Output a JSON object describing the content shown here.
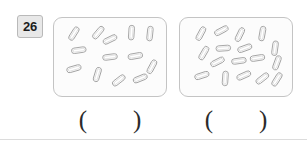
{
  "question": {
    "number": "26",
    "badge_bg": "#e8e8e8",
    "badge_border": "#b9b9b9"
  },
  "style": {
    "box_fill": "#fcfcfc",
    "box_border": "#c4c4c4",
    "pill_stroke": "#9a9a9a",
    "pill_fill": "#ffffff",
    "paren_color": "#2b2b2b"
  },
  "groups": [
    {
      "id": "left",
      "name": "left-group",
      "count": 13,
      "answer_open": "(",
      "answer_close": ")",
      "answer_value": "",
      "pills": [
        {
          "cx": 20,
          "cy": 16,
          "angle": -58
        },
        {
          "cx": 45,
          "cy": 15,
          "angle": -50
        },
        {
          "cx": 57,
          "cy": 22,
          "angle": -26
        },
        {
          "cx": 79,
          "cy": 15,
          "angle": -86
        },
        {
          "cx": 98,
          "cy": 16,
          "angle": -84
        },
        {
          "cx": 25,
          "cy": 33,
          "angle": -8
        },
        {
          "cx": 57,
          "cy": 40,
          "angle": -7
        },
        {
          "cx": 83,
          "cy": 39,
          "angle": -10
        },
        {
          "cx": 100,
          "cy": 50,
          "angle": -62
        },
        {
          "cx": 20,
          "cy": 52,
          "angle": -16
        },
        {
          "cx": 44,
          "cy": 58,
          "angle": -73
        },
        {
          "cx": 66,
          "cy": 64,
          "angle": -38
        },
        {
          "cx": 88,
          "cy": 62,
          "angle": -22
        }
      ]
    },
    {
      "id": "right",
      "name": "right-group",
      "count": 17,
      "answer_open": "(",
      "answer_close": ")",
      "answer_value": "",
      "pills": [
        {
          "cx": 21,
          "cy": 16,
          "angle": -62
        },
        {
          "cx": 42,
          "cy": 13,
          "angle": -28
        },
        {
          "cx": 61,
          "cy": 17,
          "angle": -64
        },
        {
          "cx": 84,
          "cy": 16,
          "angle": -80
        },
        {
          "cx": 24,
          "cy": 36,
          "angle": -60
        },
        {
          "cx": 44,
          "cy": 31,
          "angle": -4
        },
        {
          "cx": 66,
          "cy": 31,
          "angle": -20
        },
        {
          "cx": 97,
          "cy": 31,
          "angle": -82
        },
        {
          "cx": 38,
          "cy": 45,
          "angle": -27
        },
        {
          "cx": 60,
          "cy": 44,
          "angle": -8
        },
        {
          "cx": 79,
          "cy": 41,
          "angle": -9
        },
        {
          "cx": 99,
          "cy": 46,
          "angle": -70
        },
        {
          "cx": 22,
          "cy": 59,
          "angle": -18
        },
        {
          "cx": 46,
          "cy": 62,
          "angle": -86
        },
        {
          "cx": 65,
          "cy": 59,
          "angle": -24
        },
        {
          "cx": 84,
          "cy": 62,
          "angle": -38
        },
        {
          "cx": 99,
          "cy": 63,
          "angle": -58
        }
      ]
    }
  ]
}
